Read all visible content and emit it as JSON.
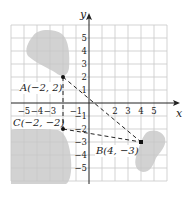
{
  "figure": {
    "axis_labels": {
      "x": "x",
      "y": "y"
    },
    "x_ticks": [
      "−5",
      "−4",
      "−3",
      "−1",
      "2",
      "3",
      "4",
      "5"
    ],
    "x_tick_values": [
      -5,
      -4,
      -3,
      -1,
      2,
      3,
      4,
      5
    ],
    "y_ticks": [
      "5",
      "4",
      "3",
      "2",
      "1",
      "−1",
      "−2",
      "−3",
      "−4",
      "−5"
    ],
    "y_tick_values": [
      5,
      4,
      3,
      2,
      1,
      -1,
      -2,
      -3,
      -4,
      -5
    ],
    "points": [
      {
        "id": "A",
        "label": "A(−2, 2)",
        "x": -2,
        "y": 2
      },
      {
        "id": "B",
        "label": "B(4, −3)",
        "x": 4,
        "y": -3
      },
      {
        "id": "C",
        "label": "C(−2, −2)",
        "x": -2,
        "y": -2
      }
    ],
    "segments": [
      {
        "from": "A",
        "to": "B",
        "style": "dashed"
      },
      {
        "from": "A",
        "to": "C",
        "style": "dashed"
      },
      {
        "from": "C",
        "to": "B",
        "style": "dashed"
      }
    ],
    "grid_range": {
      "x": [
        -6,
        6
      ],
      "y": [
        -6,
        6
      ]
    },
    "colors": {
      "grid": "#c8c8c8",
      "axis": "#222222",
      "shade": "#cfcfcf",
      "point": "#111111"
    }
  }
}
